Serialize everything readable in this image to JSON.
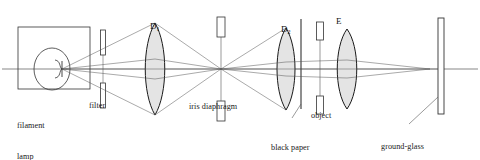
{
  "figure": {
    "kind": "optical-bench-ray-diagram",
    "width": 480,
    "height": 160,
    "background": "#ffffff",
    "ink": "#222222",
    "lens_fill": "#e2e2e2",
    "ray_color": "#555555",
    "axis_color": "#444444"
  },
  "components": {
    "lamp": {
      "label_line1": "filament",
      "label_line2": "lamp",
      "housing": {
        "x": 18,
        "y": 27,
        "w": 72,
        "h": 62
      },
      "bulb": {
        "cx": 52,
        "cy": 69,
        "rx": 18,
        "ry": 21
      },
      "filament_x": 62,
      "filament_y": 69
    },
    "filter": {
      "label": "filter",
      "x": 103,
      "top_bar": {
        "y": 30,
        "w": 5,
        "h": 25
      },
      "bottom_bar": {
        "y": 83,
        "w": 5,
        "h": 25
      }
    },
    "lens_d1": {
      "label": "D",
      "subscript": "1",
      "cx": 155,
      "cy": 69,
      "half_height": 46,
      "bulge": 11
    },
    "iris": {
      "label": "iris diaphragm",
      "x": 221,
      "top_bar": {
        "y": 17,
        "w": 8,
        "h": 20
      },
      "bottom_bar": {
        "y": 101,
        "w": 8,
        "h": 20
      }
    },
    "lens_d2": {
      "label": "D",
      "subscript": "2",
      "cx": 286,
      "cy": 69,
      "half_height": 41,
      "bulge": 10
    },
    "black_paper_aperture": {
      "label_line1": "black paper",
      "label_line2": "aperture",
      "x": 301,
      "top": 19,
      "bottom": 109
    },
    "object": {
      "label": "object",
      "x": 320,
      "top_bar": {
        "y": 22,
        "w": 7,
        "h": 18
      },
      "bottom_bar": {
        "y": 96,
        "w": 7,
        "h": 18
      }
    },
    "lens_e": {
      "label": "E",
      "cx": 347,
      "cy": 69,
      "half_height": 40,
      "bulge": 11
    },
    "screen": {
      "label_line1": "ground-glass",
      "label_line2": "screen",
      "x": 441,
      "y": 18,
      "w": 6,
      "h": 96
    }
  },
  "optical_axis": {
    "y": 69,
    "x1": 2,
    "x2": 478
  }
}
